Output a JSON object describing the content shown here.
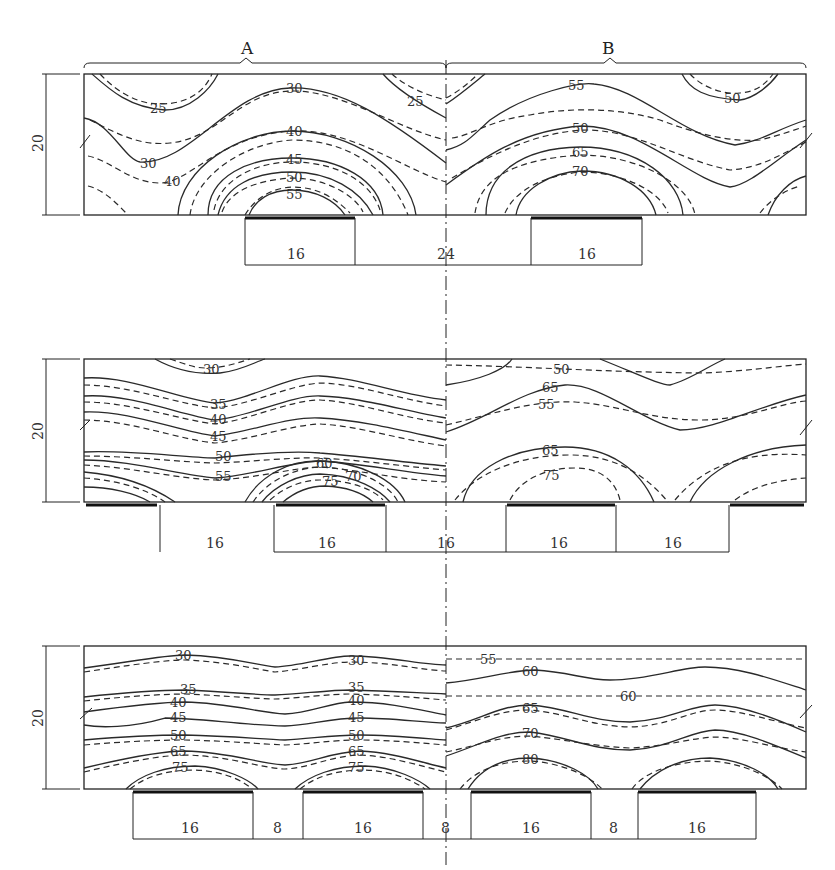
{
  "section_labels": {
    "a": "A",
    "b": "B"
  },
  "height_dim": "20",
  "panels": [
    {
      "id": "top",
      "dims": [
        "16",
        "24",
        "16"
      ],
      "contours_a": [
        "25",
        "30",
        "25",
        "40",
        "30",
        "40",
        "45",
        "50",
        "55"
      ],
      "contours_b": [
        "55",
        "50",
        "50",
        "65",
        "70"
      ]
    },
    {
      "id": "middle",
      "dims": [
        "16",
        "16",
        "16",
        "16",
        "16"
      ],
      "contours_a": [
        "30",
        "35",
        "40",
        "45",
        "50",
        "55",
        "60",
        "70",
        "75"
      ],
      "contours_b": [
        "50",
        "65",
        "55",
        "65",
        "75"
      ]
    },
    {
      "id": "bottom",
      "dims": [
        "16",
        "8",
        "16",
        "8",
        "16",
        "8",
        "16"
      ],
      "contours_a": [
        "30",
        "30",
        "35",
        "35",
        "40",
        "40",
        "45",
        "45",
        "50",
        "50",
        "65",
        "65",
        "75",
        "75"
      ],
      "contours_b": [
        "55",
        "60",
        "60",
        "65",
        "70",
        "80"
      ]
    }
  ]
}
